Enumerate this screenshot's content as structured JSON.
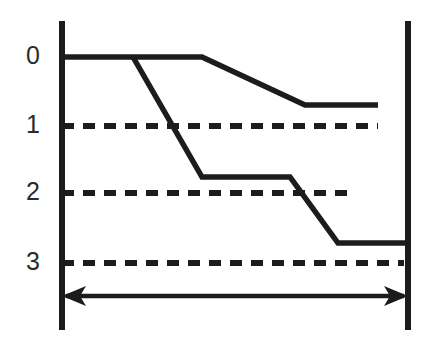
{
  "figure": {
    "title": "",
    "type": "line-diagram",
    "background_color": "#ffffff",
    "ink_color": "#1c1c1c",
    "label_color": "#2b2b2b"
  },
  "axis": {
    "left_axis_name": "left-vertical-axis",
    "right_axis_name": "right-vertical-axis",
    "left_x": 62,
    "right_x": 408,
    "top_y": 21,
    "bottom_y": 330,
    "tick_labels": [
      "0",
      "1",
      "2",
      "3"
    ],
    "tick_values": [
      0,
      1,
      2,
      3
    ],
    "tick_y": [
      57,
      126,
      193,
      263
    ],
    "label_x": 33
  },
  "gridlines": {
    "style": "dashed",
    "dash_pattern": "12 9",
    "lines": [
      {
        "label": "1",
        "y": 126,
        "x_start": 62,
        "x_end": 378
      },
      {
        "label": "2",
        "y": 193,
        "x_start": 62,
        "x_end": 352
      },
      {
        "label": "3",
        "y": 263,
        "x_start": 62,
        "x_end": 404
      }
    ]
  },
  "chart_data": {
    "type": "line",
    "title": "",
    "xlabel": "",
    "ylabel": "",
    "y_axis_direction": "downward",
    "ylim": [
      0,
      3.25
    ],
    "yticks": [
      0,
      1,
      2,
      3
    ],
    "ytick_labels": [
      "0",
      "1",
      "2",
      "3"
    ],
    "grid": "dashed-horizontal",
    "legend": "none",
    "series": [
      {
        "name": "upper-curve",
        "points_px": [
          [
            62,
            57
          ],
          [
            202,
            57
          ],
          [
            305,
            105
          ],
          [
            378,
            105
          ]
        ],
        "points_data": [
          [
            0.0,
            0.0
          ],
          [
            0.41,
            0.0
          ],
          [
            0.71,
            0.7
          ],
          [
            0.92,
            0.7
          ]
        ]
      },
      {
        "name": "lower-curve",
        "points_px": [
          [
            133,
            57
          ],
          [
            202,
            177
          ],
          [
            290,
            177
          ],
          [
            338,
            243
          ],
          [
            408,
            243
          ]
        ],
        "points_data": [
          [
            0.21,
            0.0
          ],
          [
            0.41,
            1.74
          ],
          [
            0.67,
            1.74
          ],
          [
            0.81,
            2.7
          ],
          [
            1.0,
            2.7
          ]
        ]
      }
    ]
  },
  "span_arrow": {
    "name": "horizontal-span-arrow",
    "y": 296,
    "x_start": 62,
    "x_end": 408,
    "heads": "both",
    "label": ""
  }
}
